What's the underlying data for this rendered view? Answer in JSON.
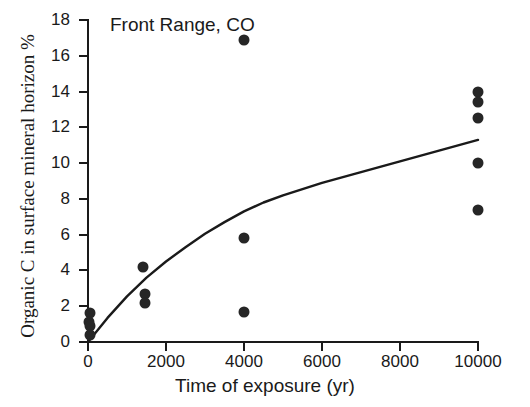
{
  "chart_data": {
    "type": "scatter",
    "title": "Front Range, CO",
    "xlabel": "Time of exposure (yr)",
    "ylabel": "Organic C in surface mineral horizon %",
    "xlim": [
      0,
      10000
    ],
    "ylim": [
      0,
      18
    ],
    "xticks": [
      0,
      2000,
      4000,
      6000,
      8000,
      10000
    ],
    "xtick_labels": [
      "0",
      "2000",
      "4000",
      "6000",
      "8000",
      "10000"
    ],
    "yticks": [
      0,
      2,
      4,
      6,
      8,
      10,
      12,
      14,
      16,
      18
    ],
    "ytick_labels": [
      "0",
      "2",
      "4",
      "6",
      "8",
      "10",
      "12",
      "14",
      "16",
      "18"
    ],
    "grid": false,
    "legend": false,
    "marker_color": "#262626",
    "line_color": "#1a1a1a",
    "series": [
      {
        "name": "Organic C observations",
        "type": "scatter",
        "points": [
          {
            "x": 50,
            "y": 1.6
          },
          {
            "x": 20,
            "y": 1.1
          },
          {
            "x": 60,
            "y": 0.9
          },
          {
            "x": 40,
            "y": 0.4
          },
          {
            "x": 1400,
            "y": 4.2
          },
          {
            "x": 1450,
            "y": 2.7
          },
          {
            "x": 1450,
            "y": 2.2
          },
          {
            "x": 4000,
            "y": 16.9
          },
          {
            "x": 4000,
            "y": 5.8
          },
          {
            "x": 4000,
            "y": 1.7
          },
          {
            "x": 10000,
            "y": 14.0
          },
          {
            "x": 10000,
            "y": 13.4
          },
          {
            "x": 10000,
            "y": 12.5
          },
          {
            "x": 10000,
            "y": 10.0
          },
          {
            "x": 10000,
            "y": 7.4
          }
        ]
      },
      {
        "name": "Fitted accumulation curve",
        "type": "line",
        "points": [
          {
            "x": 0,
            "y": 0.0
          },
          {
            "x": 500,
            "y": 1.35
          },
          {
            "x": 1000,
            "y": 2.55
          },
          {
            "x": 1500,
            "y": 3.6
          },
          {
            "x": 2000,
            "y": 4.5
          },
          {
            "x": 2500,
            "y": 5.3
          },
          {
            "x": 3000,
            "y": 6.05
          },
          {
            "x": 3500,
            "y": 6.7
          },
          {
            "x": 4000,
            "y": 7.3
          },
          {
            "x": 4500,
            "y": 7.8
          },
          {
            "x": 5000,
            "y": 8.2
          },
          {
            "x": 6000,
            "y": 8.9
          },
          {
            "x": 7000,
            "y": 9.5
          },
          {
            "x": 8000,
            "y": 10.1
          },
          {
            "x": 9000,
            "y": 10.7
          },
          {
            "x": 10000,
            "y": 11.3
          }
        ]
      }
    ]
  }
}
